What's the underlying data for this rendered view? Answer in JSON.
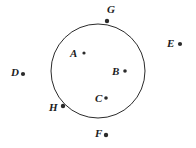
{
  "figure": {
    "type": "geometry-diagram",
    "background_color": "#ffffff",
    "stroke_color": "#2b2b2b",
    "label_color": "#1c1c1c",
    "circle": {
      "name": "circle-outline",
      "center_x": 98,
      "center_y": 71,
      "radius": 47,
      "stroke_width": 1
    },
    "points": [
      {
        "id": "A",
        "label": "A",
        "dot_x": 84,
        "dot_y": 53,
        "label_x": 70,
        "label_y": 48,
        "dot_r": 1.6,
        "position": "inside"
      },
      {
        "id": "B",
        "label": "B",
        "dot_x": 125,
        "dot_y": 71,
        "label_x": 112,
        "label_y": 66,
        "dot_r": 1.8,
        "position": "inside"
      },
      {
        "id": "C",
        "label": "C",
        "dot_x": 106,
        "dot_y": 98,
        "label_x": 95,
        "label_y": 93,
        "dot_r": 1.8,
        "position": "inside"
      },
      {
        "id": "D",
        "label": "D",
        "dot_x": 23,
        "dot_y": 74,
        "label_x": 11,
        "label_y": 67,
        "dot_r": 2.1,
        "position": "outside"
      },
      {
        "id": "E",
        "label": "E",
        "dot_x": 180,
        "dot_y": 44,
        "label_x": 167,
        "label_y": 38,
        "dot_r": 2.1,
        "position": "outside"
      },
      {
        "id": "F",
        "label": "F",
        "dot_x": 106,
        "dot_y": 135,
        "label_x": 95,
        "label_y": 128,
        "dot_r": 2.2,
        "position": "outside"
      },
      {
        "id": "G",
        "label": "G",
        "dot_x": 107,
        "dot_y": 21,
        "label_x": 107,
        "label_y": 4,
        "dot_r": 2.2,
        "position": "on-circle"
      },
      {
        "id": "H",
        "label": "H",
        "dot_x": 63,
        "dot_y": 106,
        "label_x": 49,
        "label_y": 102,
        "dot_r": 2.2,
        "position": "on-circle"
      }
    ]
  }
}
